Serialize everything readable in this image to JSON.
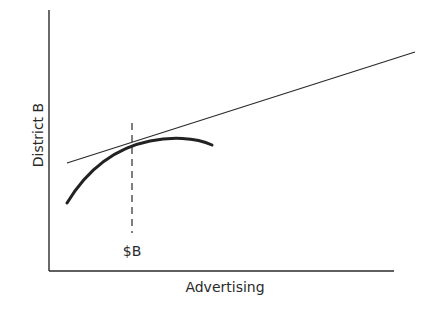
{
  "diagram": {
    "y_axis_label": "District B",
    "x_axis_label": "Advertising",
    "marker_label": "$B",
    "elements": {
      "y_axis": {
        "x": 49,
        "y_top": 10,
        "y_bottom": 271
      },
      "x_axis": {
        "y": 271,
        "x_left": 49,
        "x_right": 394
      },
      "tangent_line": {
        "x1": 67,
        "y1": 163,
        "x2": 415,
        "y2": 52
      },
      "response_curve": {
        "start": [
          67,
          203
        ],
        "control": [
          130,
          120
        ],
        "end": [
          212,
          145
        ]
      },
      "dashed_marker": {
        "x": 132,
        "y_top": 123,
        "y_bottom": 233
      }
    },
    "colors": {
      "ink": "#2a2a2a",
      "background": "#ffffff"
    }
  }
}
